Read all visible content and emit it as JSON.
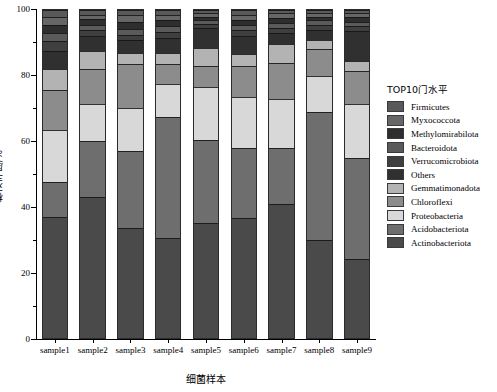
{
  "chart_data": {
    "type": "bar",
    "subtype": "stacked-percentage",
    "title": "",
    "xlabel": "细菌样本",
    "ylabel": "相对丰度/%",
    "ylim": [
      0,
      100
    ],
    "yticks": [
      0,
      20,
      40,
      60,
      80,
      100
    ],
    "ytick_labels": [
      "0",
      "20",
      "40",
      "60",
      "80",
      "100"
    ],
    "grid": false,
    "legend_position": "right",
    "legend_title": "TOP10门水平",
    "categories": [
      "sample1",
      "sample2",
      "sample3",
      "sample4",
      "sample5",
      "sample6",
      "sample7",
      "sample8",
      "sample9"
    ],
    "stack_order_bottom_to_top": [
      "Actinobacteriota",
      "Acidobacteriota",
      "Proteobacteria",
      "Chloroflexi",
      "Gemmatimonadota",
      "Others",
      "Verrucomicrobiota",
      "Bacteroidota",
      "Methylomirabilota",
      "Myxococcota",
      "Firmicutes"
    ],
    "series": [
      {
        "name": "Actinobacteriota",
        "color": "#4a4a4a",
        "values": [
          37.0,
          43.0,
          33.5,
          30.5,
          35.0,
          36.5,
          41.0,
          30.0,
          24.0
        ]
      },
      {
        "name": "Acidobacteriota",
        "color": "#6e6e6e",
        "values": [
          10.5,
          17.0,
          23.5,
          37.0,
          25.5,
          21.5,
          17.0,
          39.0,
          31.0
        ]
      },
      {
        "name": "Proteobacteria",
        "color": "#d8d8d8",
        "values": [
          16.0,
          11.5,
          13.0,
          10.0,
          16.0,
          15.5,
          15.0,
          11.0,
          16.5
        ]
      },
      {
        "name": "Chloroflexi",
        "color": "#8c8c8c",
        "values": [
          12.0,
          10.5,
          13.5,
          6.0,
          6.5,
          9.5,
          11.0,
          8.0,
          10.0
        ]
      },
      {
        "name": "Gemmatimonadota",
        "color": "#b3b3b3",
        "values": [
          6.5,
          5.5,
          3.5,
          3.5,
          5.5,
          3.5,
          5.5,
          3.0,
          3.0
        ]
      },
      {
        "name": "Others",
        "color": "#303030",
        "values": [
          5.5,
          4.5,
          4.0,
          4.5,
          6.0,
          5.5,
          3.5,
          3.0,
          9.0
        ]
      },
      {
        "name": "Verrucomicrobiota",
        "color": "#3f3f3f",
        "values": [
          3.0,
          1.8,
          1.5,
          1.8,
          1.2,
          1.8,
          1.5,
          1.5,
          1.5
        ]
      },
      {
        "name": "Bacteroidota",
        "color": "#5a5a5a",
        "values": [
          2.5,
          1.8,
          1.8,
          1.8,
          1.2,
          1.8,
          1.5,
          1.5,
          1.5
        ]
      },
      {
        "name": "Methylomirabilota",
        "color": "#2e2e2e",
        "values": [
          2.5,
          1.6,
          2.0,
          1.8,
          1.1,
          1.4,
          1.5,
          1.0,
          1.5
        ]
      },
      {
        "name": "Myxococcota",
        "color": "#666666",
        "values": [
          2.5,
          1.3,
          2.2,
          1.6,
          1.0,
          1.5,
          1.5,
          1.0,
          1.0
        ]
      },
      {
        "name": "Firmicutes",
        "color": "#595959",
        "values": [
          2.0,
          1.5,
          1.5,
          1.5,
          1.0,
          1.5,
          1.0,
          1.0,
          1.0
        ]
      }
    ]
  },
  "legend": {
    "title": "TOP10门水平",
    "items": [
      {
        "label": "Firmicutes",
        "color": "#595959"
      },
      {
        "label": "Myxococcota",
        "color": "#666666"
      },
      {
        "label": "Methylomirabilota",
        "color": "#2e2e2e"
      },
      {
        "label": "Bacteroidota",
        "color": "#5a5a5a"
      },
      {
        "label": "Verrucomicrobiota",
        "color": "#3f3f3f"
      },
      {
        "label": "Others",
        "color": "#303030"
      },
      {
        "label": "Gemmatimonadota",
        "color": "#b3b3b3"
      },
      {
        "label": "Chloroflexi",
        "color": "#8c8c8c"
      },
      {
        "label": "Proteobacteria",
        "color": "#d8d8d8"
      },
      {
        "label": "Acidobacteriota",
        "color": "#6e6e6e"
      },
      {
        "label": "Actinobacteriota",
        "color": "#4a4a4a"
      }
    ]
  },
  "axes": {
    "y_title": "相对丰度/%",
    "x_title": "细菌样本",
    "y_tick_labels": [
      "100",
      "80",
      "60",
      "40",
      "20",
      "0"
    ]
  }
}
